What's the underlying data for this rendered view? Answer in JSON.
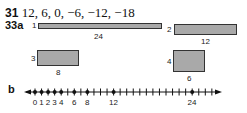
{
  "q31": {
    "number": "31",
    "answer": "12, 6, 0, −6, −12,  −18"
  },
  "q33a": {
    "label": "33a",
    "rectangles": [
      {
        "index": "1",
        "width_label": "24",
        "height_label": "1"
      },
      {
        "index": "2",
        "width_label": "12",
        "height_label": "2"
      },
      {
        "index": "3",
        "width_label": "8",
        "height_label": "3"
      },
      {
        "index": "4",
        "width_label": "6",
        "height_label": "4"
      }
    ]
  },
  "q33b": {
    "label": "b",
    "number_line": {
      "min": 0,
      "max": 27,
      "marked_points": [
        0,
        1,
        2,
        3,
        4,
        6,
        8,
        12,
        24
      ],
      "tick_labels": [
        "0",
        "1",
        "2",
        "3",
        "4",
        "6",
        "8",
        "12",
        "24"
      ]
    }
  },
  "colors": {
    "rect_fill": "#a9a9a9",
    "stroke": "#333333"
  }
}
